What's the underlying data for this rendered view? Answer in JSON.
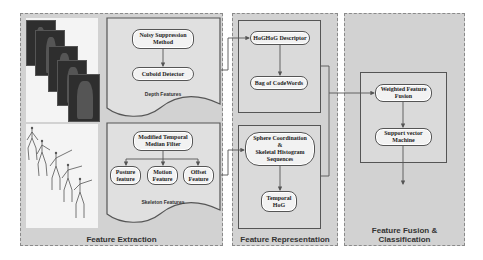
{
  "panels": {
    "extraction": {
      "title": "Feature Extraction"
    },
    "representation": {
      "title": "Feature Representation"
    },
    "fusion": {
      "title": "Feature Fusion & Classification"
    }
  },
  "depth_features": {
    "caption": "Depth Features",
    "nodes": {
      "noisy_suppression": "Noisy Suppression\nMethod",
      "cuboid_detector": "Cuboid Detector"
    }
  },
  "skeleton_features": {
    "caption": "Skeleton Features",
    "nodes": {
      "modified_temporal": "Modified Temporal\nMedian Filter",
      "posture": "Posture\nfeature",
      "motion": "Motion\nFeature",
      "offset": "Offset\nFeature"
    }
  },
  "representation": {
    "nodes": {
      "hoghog": "HoGHoG Descriptor",
      "bag_of_codewords": "Bag of CodeWords",
      "sphere": "Sphere Coordination\n&\nSkeletal Histogram\nSequences",
      "temporal_hog": "Temporal\nHoG"
    }
  },
  "fusion": {
    "nodes": {
      "weighted_fusion": "Weighted Feature\nFusion",
      "svm": "Support vector\nMachine"
    }
  },
  "colors": {
    "panel_bg": "#d2d2d2",
    "node_bg": "#f2f2f2",
    "line": "#555555"
  }
}
